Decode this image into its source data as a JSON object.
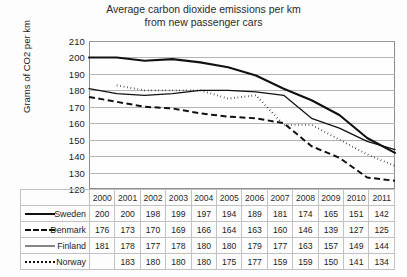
{
  "chart_data": {
    "type": "line",
    "title": "Average carbon dioxide emissions per km from new passenger cars",
    "title_line1": "Average carbon dioxide emissions per km",
    "title_line2": "from new passenger cars",
    "xlabel": "",
    "ylabel": "Grams of CO2 per km",
    "ylim": [
      120,
      210
    ],
    "ytick_step": 10,
    "yticks": [
      210,
      200,
      190,
      180,
      170,
      160,
      150,
      140,
      130,
      120
    ],
    "grid": true,
    "legend_position": "table-left-column",
    "categories": [
      "2000",
      "2001",
      "2002",
      "2003",
      "2004",
      "2005",
      "2006",
      "2007",
      "2008",
      "2009",
      "2010",
      "2011"
    ],
    "series": [
      {
        "name": "Sweden",
        "style": "solid-thick",
        "swatch": "sw-solid-thick",
        "values": [
          200,
          200,
          198,
          199,
          197,
          194,
          189,
          181,
          174,
          165,
          151,
          142
        ]
      },
      {
        "name": "Denmark",
        "style": "dashed",
        "swatch": "sw-dashed",
        "values": [
          176,
          173,
          170,
          169,
          166,
          164,
          163,
          160,
          146,
          139,
          127,
          125
        ]
      },
      {
        "name": "Finland",
        "style": "solid-thin",
        "swatch": "sw-solid-thin",
        "values": [
          181,
          178,
          177,
          178,
          180,
          180,
          179,
          177,
          163,
          157,
          149,
          144
        ]
      },
      {
        "name": "Norway",
        "style": "dotted",
        "swatch": "sw-dotted",
        "values": [
          null,
          183,
          180,
          180,
          180,
          175,
          177,
          159,
          159,
          150,
          141,
          134
        ]
      }
    ]
  },
  "table": {
    "corner_label": "",
    "header": [
      "2000",
      "2001",
      "2002",
      "2003",
      "2004",
      "2005",
      "2006",
      "2007",
      "2008",
      "2009",
      "2010",
      "2011"
    ],
    "rows": [
      {
        "label": "Sweden",
        "cells": [
          "200",
          "200",
          "198",
          "199",
          "197",
          "194",
          "189",
          "181",
          "174",
          "165",
          "151",
          "142"
        ]
      },
      {
        "label": "Denmark",
        "cells": [
          "176",
          "173",
          "170",
          "169",
          "166",
          "164",
          "163",
          "160",
          "146",
          "139",
          "127",
          "125"
        ]
      },
      {
        "label": "Finland",
        "cells": [
          "181",
          "178",
          "177",
          "178",
          "180",
          "180",
          "179",
          "177",
          "163",
          "157",
          "149",
          "144"
        ]
      },
      {
        "label": "Norway",
        "cells": [
          "",
          "183",
          "180",
          "180",
          "180",
          "175",
          "177",
          "159",
          "159",
          "150",
          "141",
          "134"
        ]
      }
    ]
  },
  "colors": {
    "line": "#111111",
    "grid": "#b4b4b4",
    "frame": "#8d8d8d",
    "table_border": "#c2c2c2",
    "background": "#fdfdfd"
  }
}
